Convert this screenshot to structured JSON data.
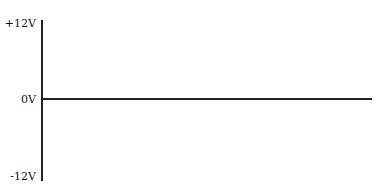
{
  "diagram": {
    "axis_labels": {
      "top": "+12V",
      "middle": "0V",
      "bottom": "-12V"
    },
    "signal": {
      "description": "flat line at 0V",
      "level": "0V"
    },
    "colors": {
      "line": "#222222",
      "background": "#ffffff"
    }
  }
}
